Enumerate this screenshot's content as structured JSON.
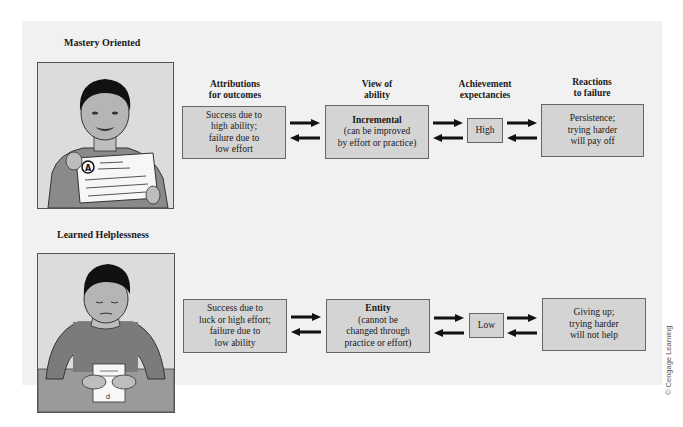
{
  "column_headers": [
    {
      "line1": "Attributions",
      "line2": "for outcomes"
    },
    {
      "line1": "View of",
      "line2": "ability"
    },
    {
      "line1": "Achievement",
      "line2": "expectancies"
    },
    {
      "line1": "Reactions",
      "line2": "to failure"
    }
  ],
  "rows": [
    {
      "title": "Mastery Oriented",
      "illustration": "boy-holding-graded-paper-with-A",
      "attribution": [
        "Success due to",
        "high ability;",
        "failure due to",
        "low effort"
      ],
      "ability": {
        "heading": "Incremental",
        "lines": [
          "(can be improved",
          "by effort or practice)"
        ]
      },
      "expectancy": "High",
      "reaction": [
        "Persistence;",
        "trying harder",
        "will pay off"
      ]
    },
    {
      "title": "Learned Helplessness",
      "illustration": "boy-looking-down-at-paper-on-desk",
      "attribution": [
        "Success due to",
        "luck or high effort;",
        "failure due to",
        "low ability"
      ],
      "ability": {
        "heading": "Entity",
        "lines": [
          "(cannot be",
          "changed through",
          "practice or effort)"
        ]
      },
      "expectancy": "Low",
      "reaction": [
        "Giving up;",
        "trying harder",
        "will not help"
      ]
    }
  ],
  "credit": "© Cengage Learning",
  "colors": {
    "panel": "#f1f1f1",
    "box_fill": "#d4d4d4",
    "box_border": "#666666",
    "arrow": "#111111"
  }
}
